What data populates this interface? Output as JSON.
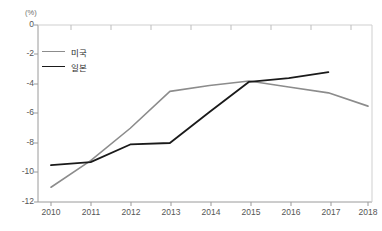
{
  "chart_data": {
    "type": "line",
    "title": "",
    "subtitle": "",
    "xlabel": "",
    "ylabel": "",
    "unit_label": "(%)",
    "x": [
      "2010",
      "2011",
      "2012",
      "2013",
      "2014",
      "2015",
      "2016",
      "2017",
      "2018"
    ],
    "categories": [
      "2010",
      "2011",
      "2012",
      "2013",
      "2014",
      "2015",
      "2016",
      "2017",
      "2018"
    ],
    "ylim": [
      -12,
      0
    ],
    "yticks": [
      0,
      -2,
      -4,
      -6,
      -8,
      -10,
      -12
    ],
    "ytick_labels": [
      "0",
      "-2",
      "-4",
      "-6",
      "-8",
      "-10",
      "-12"
    ],
    "xtick_labels": [
      "2010",
      "2011",
      "2012",
      "2013",
      "2014",
      "2015",
      "2016",
      "2017",
      "2018"
    ],
    "grid": false,
    "legend_position": "upper-left-inside",
    "series": [
      {
        "name": "미국",
        "color": "#8c8c8c",
        "values": [
          -11.0,
          -9.2,
          -7.0,
          -4.5,
          -4.1,
          -3.8,
          -4.2,
          -4.6,
          -5.5
        ]
      },
      {
        "name": "일본",
        "color": "#1a1a1a",
        "values": [
          -9.5,
          -9.3,
          -8.1,
          -8.0,
          -5.9,
          -3.85,
          -3.6,
          -3.2,
          null
        ]
      }
    ]
  },
  "legend": {
    "items": [
      {
        "label": "미국",
        "color": "#8c8c8c"
      },
      {
        "label": "일본",
        "color": "#1a1a1a"
      }
    ]
  },
  "axes": {
    "unit": "(%)",
    "axis_color": "#9a9a9a"
  }
}
